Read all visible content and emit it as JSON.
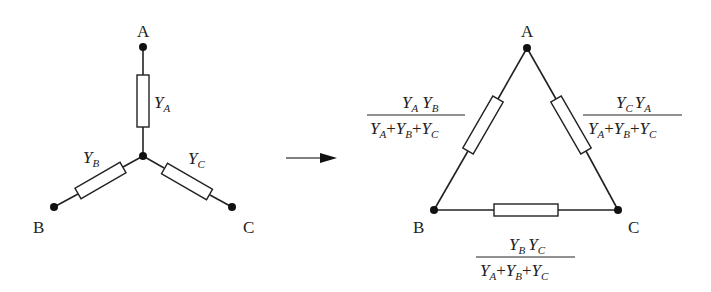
{
  "diagram": {
    "star": {
      "nodes": [
        {
          "id": "A",
          "label": "A"
        },
        {
          "id": "B",
          "label": "B"
        },
        {
          "id": "C",
          "label": "C"
        }
      ],
      "branches": [
        {
          "id": "YA",
          "var": "Y",
          "sub": "A"
        },
        {
          "id": "YB",
          "var": "Y",
          "sub": "B"
        },
        {
          "id": "YC",
          "var": "Y",
          "sub": "C"
        }
      ]
    },
    "arrow": {
      "direction": "right"
    },
    "delta": {
      "nodes": [
        {
          "id": "A",
          "label": "A"
        },
        {
          "id": "B",
          "label": "B"
        },
        {
          "id": "C",
          "label": "C"
        }
      ],
      "branches": [
        {
          "id": "AB",
          "numerator": "YA YB",
          "denominator": "YA + YB + YC"
        },
        {
          "id": "CA",
          "numerator": "YC YA",
          "denominator": "YA + YB + YC"
        },
        {
          "id": "BC",
          "numerator": "YB YC",
          "denominator": "YA + YB + YC"
        }
      ]
    },
    "symbols": {
      "Y": "Y",
      "A": "A",
      "B": "B",
      "C": "C",
      "plus": "+"
    }
  }
}
